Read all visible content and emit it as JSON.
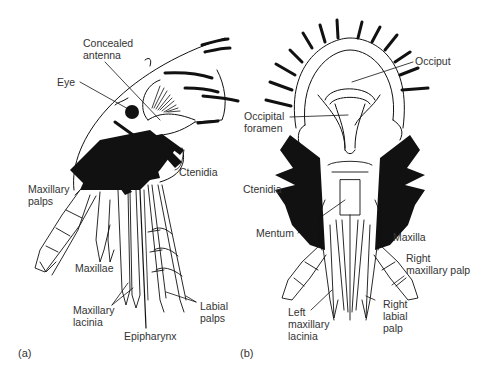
{
  "figure": {
    "panels": [
      {
        "id": "(a)",
        "view": "lateral",
        "labels": {
          "concealed_antenna": "Concealed\nantenna",
          "eye": "Eye",
          "ctenidia": "Ctenidia",
          "maxillary_palps": "Maxillary\npalps",
          "maxillae": "Maxillae",
          "maxillary_lacinia": "Maxillary\nlacinia",
          "epipharynx": "Epipharynx",
          "labial_palps": "Labial\npalps"
        }
      },
      {
        "id": "(b)",
        "view": "posterior",
        "labels": {
          "occiput": "Occiput",
          "occipital_foramen": "Occipital\nforamen",
          "ctenidia": "Ctenidia",
          "mentum": "Mentum",
          "maxilla": "Maxilla",
          "right_maxillary_palp": "Right\nmaxillary palp",
          "left_maxillary_lacinia": "Left\nmaxillary\nlacinia",
          "right_labial_palp": "Right\nlabial\npalp"
        }
      }
    ],
    "colors": {
      "ink": "#111111",
      "text": "#333333",
      "background": "#ffffff"
    }
  }
}
